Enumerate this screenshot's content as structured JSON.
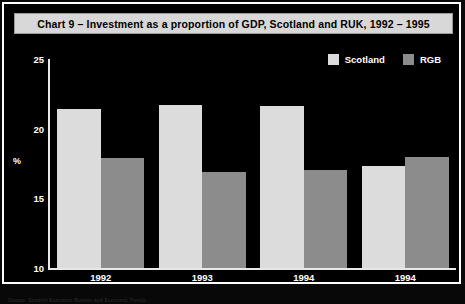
{
  "chart_title": "Chart 9 – Investment as a proportion of GDP, Scotland and RUK, 1992 – 1995",
  "legend": {
    "entries": [
      {
        "label": "Scotland",
        "color": "#dcdcdc"
      },
      {
        "label": "RGB",
        "color": "#8c8c8c"
      }
    ]
  },
  "axes": {
    "y_title": "%",
    "y_ticks": [
      "10",
      "15",
      "20",
      "25"
    ],
    "x_ticks": [
      "1992",
      "1993",
      "1994",
      "1994"
    ]
  },
  "colors": {
    "background": "#000000",
    "frame": "#ffffff",
    "title_bar": "#d8d8d8",
    "title_text": "#000000",
    "axis": "#e8e8e8",
    "tick_text": "#ffffff",
    "scotland_bar": "#dcdcdc",
    "ruk_bar": "#8c8c8c"
  },
  "caption": "Source: Scottish Economic Bulletin and Economic Trends",
  "chart_data": {
    "type": "bar",
    "title": "Chart 9 – Investment as a proportion of GDP, Scotland and RUK, 1992 – 1995",
    "xlabel": "",
    "ylabel": "%",
    "ylim": [
      10,
      25
    ],
    "yticks": [
      10,
      15,
      20,
      25
    ],
    "grid": false,
    "legend_position": "top-right",
    "categories": [
      "1992",
      "1993",
      "1994",
      "1994"
    ],
    "series": [
      {
        "name": "Scotland",
        "color": "#dcdcdc",
        "values": [
          21.4,
          21.7,
          21.6,
          17.3
        ]
      },
      {
        "name": "RGB",
        "color": "#8c8c8c",
        "values": [
          17.9,
          16.9,
          17.0,
          18.0
        ]
      }
    ]
  }
}
